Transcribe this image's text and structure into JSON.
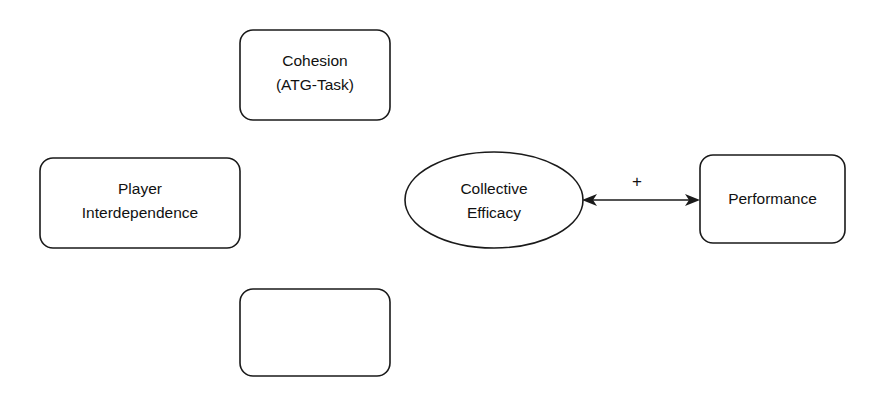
{
  "diagram": {
    "type": "conceptual-model-diagram",
    "background_color": "#ffffff",
    "stroke_color": "#1a1a1a",
    "text_color": "#111111",
    "nodes": [
      {
        "id": "cohesion",
        "shape": "rounded-rectangle",
        "line1": "Cohesion",
        "line2": "(ATG-Task)",
        "x": 240,
        "y": 30,
        "width": 150,
        "height": 90,
        "radius": 13
      },
      {
        "id": "player-interdependence",
        "shape": "rounded-rectangle",
        "line1": "Player",
        "line2": "Interdependence",
        "x": 40,
        "y": 158,
        "width": 200,
        "height": 90,
        "radius": 13
      },
      {
        "id": "blank",
        "shape": "rounded-rectangle",
        "line1": "",
        "line2": "",
        "x": 240,
        "y": 289,
        "width": 150,
        "height": 87,
        "radius": 13
      },
      {
        "id": "collective-efficacy",
        "shape": "ellipse",
        "line1": "Collective",
        "line2": "Efficacy",
        "cx": 494,
        "cy": 200,
        "rx": 89,
        "ry": 48
      },
      {
        "id": "performance",
        "shape": "rounded-rectangle",
        "line1": "Performance",
        "line2": "",
        "x": 700,
        "y": 155,
        "width": 145,
        "height": 88,
        "radius": 13
      }
    ],
    "links": [
      {
        "id": "efficacy-performance",
        "from": "collective-efficacy",
        "to": "performance",
        "sign": "+",
        "sign_x": 637,
        "sign_y": 183,
        "x1": 583,
        "x2": 699,
        "y": 200,
        "arrow_start": true,
        "arrow_end": true
      }
    ]
  }
}
